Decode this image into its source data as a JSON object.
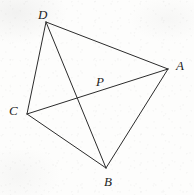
{
  "figure": {
    "kind": "geometry-diagram",
    "canvas": {
      "width": 194,
      "height": 195
    },
    "background_color": "#fdfdfc",
    "stroke_color": "#2b2b2b",
    "stroke_width": 1,
    "label_color": "#1d1d1d",
    "points": [
      {
        "id": "D",
        "label": "D",
        "x": 46,
        "y": 22,
        "label_x": 38,
        "label_y": 8
      },
      {
        "id": "A",
        "label": "A",
        "x": 168,
        "y": 69,
        "label_x": 176,
        "label_y": 59
      },
      {
        "id": "P",
        "label": "P",
        "x": 96,
        "y": 92,
        "label_x": 96,
        "label_y": 75
      },
      {
        "id": "C",
        "label": "C",
        "x": 27,
        "y": 114,
        "label_x": 9,
        "label_y": 104
      },
      {
        "id": "B",
        "label": "B",
        "x": 106,
        "y": 168,
        "label_x": 104,
        "label_y": 175
      }
    ],
    "segments": [
      {
        "id": "DA",
        "from": "D",
        "to": "A",
        "label": "D to A"
      },
      {
        "id": "DC",
        "from": "D",
        "to": "C",
        "label": "D to C"
      },
      {
        "id": "DB",
        "from": "D",
        "to": "B",
        "label": "D to B (diagonal through P)"
      },
      {
        "id": "CA",
        "from": "C",
        "to": "A",
        "label": "C to A (diagonal through P)"
      },
      {
        "id": "CB",
        "from": "C",
        "to": "B",
        "label": "C to B"
      },
      {
        "id": "BA",
        "from": "B",
        "to": "A",
        "label": "B to A"
      }
    ]
  }
}
